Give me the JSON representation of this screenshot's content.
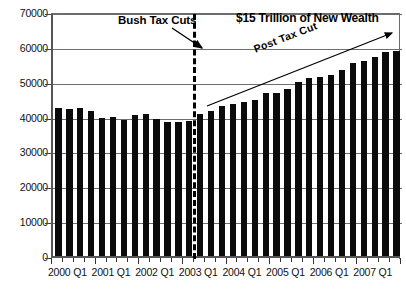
{
  "chart_data": {
    "type": "bar",
    "title": "",
    "xlabel": "",
    "ylabel": "",
    "ylim": [
      0,
      70000
    ],
    "grid": true,
    "legend": "none",
    "y_ticks": [
      "0",
      "10000",
      "20000",
      "30000",
      "40000",
      "50000",
      "60000",
      "70000"
    ],
    "y_tick_values": [
      0,
      10000,
      20000,
      30000,
      40000,
      50000,
      60000,
      70000
    ],
    "x_tick_labels": [
      "2000 Q1",
      "2001 Q1",
      "2002 Q1",
      "2003 Q1",
      "2004 Q1",
      "2005 Q1",
      "2006 Q1",
      "2007 Q1"
    ],
    "categories": [
      "2000 Q1",
      "2000 Q2",
      "2000 Q3",
      "2000 Q4",
      "2001 Q1",
      "2001 Q2",
      "2001 Q3",
      "2001 Q4",
      "2002 Q1",
      "2002 Q2",
      "2002 Q3",
      "2002 Q4",
      "2003 Q1",
      "2003 Q2",
      "2003 Q3",
      "2003 Q4",
      "2004 Q1",
      "2004 Q2",
      "2004 Q3",
      "2004 Q4",
      "2005 Q1",
      "2005 Q2",
      "2005 Q3",
      "2005 Q4",
      "2006 Q1",
      "2006 Q2",
      "2006 Q3",
      "2006 Q4",
      "2007 Q1",
      "2007 Q2",
      "2007 Q3",
      "2007 Q4"
    ],
    "values": [
      42500,
      42200,
      42600,
      41600,
      39500,
      40000,
      38900,
      40500,
      40800,
      39200,
      38500,
      38500,
      38600,
      40800,
      41500,
      43000,
      43700,
      44300,
      44900,
      46700,
      46800,
      48000,
      50000,
      51000,
      51300,
      52000,
      53500,
      55300,
      56000,
      57000,
      58500,
      58800
    ],
    "bar_color": "#0b0b0b",
    "gridline_color": "#6e6e6e",
    "annotations": [
      {
        "name": "bush-tax-cuts",
        "text": "Bush Tax Cuts",
        "type": "arrow-label",
        "points_to": "2003 Q1 / Q2 boundary"
      },
      {
        "name": "new-wealth",
        "text": "$15 Trillion of New Wealth",
        "type": "label"
      },
      {
        "name": "post-tax-cut",
        "text": "Post Tax Cut",
        "type": "trend-arrow-label",
        "rotation_deg": -21
      }
    ],
    "divider": {
      "name": "tax-cut-divider",
      "style": "dashed-vertical",
      "at_category": "2003 Q2"
    }
  },
  "caption": {
    "text": ""
  }
}
